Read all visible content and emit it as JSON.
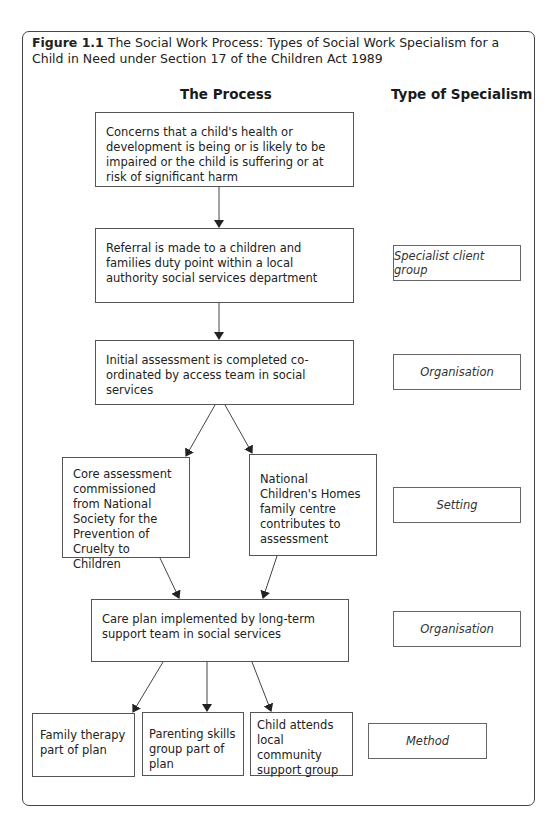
{
  "figure": {
    "label": "Figure 1.1",
    "caption": "The Social Work Process: Types of Social Work Specialism for a Child in Need under Section 17 of the Children Act 1989"
  },
  "headings": {
    "process": "The Process",
    "specialism": "Type of Specialism"
  },
  "process_steps": [
    {
      "id": "concerns",
      "text": "Concerns that a child's health or development is being or is likely to be impaired or the child is suffering or at risk of significant harm"
    },
    {
      "id": "referral",
      "text": "Referral is made to a children and families duty point within a local authority social services department"
    },
    {
      "id": "initial_assessment",
      "text": "Initial assessment is completed co-ordinated by access team in social services"
    },
    {
      "id": "core_assessment",
      "text": "Core assessment commissioned from National Society for the Prevention of Cruelty to Children"
    },
    {
      "id": "nch_centre",
      "text": "National Children's Homes family centre contributes to assessment"
    },
    {
      "id": "care_plan",
      "text": "Care plan implemented by long-term support team in social services"
    },
    {
      "id": "family_therapy",
      "text": "Family therapy part of plan"
    },
    {
      "id": "parenting_skills",
      "text": "Parenting skills group part of plan"
    },
    {
      "id": "community_group",
      "text": "Child attends local community support group"
    }
  ],
  "specialisms": [
    {
      "level": "referral",
      "text": "Specialist client group"
    },
    {
      "level": "initial_assessment",
      "text": "Organisation"
    },
    {
      "level": "assessment",
      "text": "Setting"
    },
    {
      "level": "care_plan",
      "text": "Organisation"
    },
    {
      "level": "plan_components",
      "text": "Method"
    }
  ],
  "edges": [
    [
      "concerns",
      "referral"
    ],
    [
      "referral",
      "initial_assessment"
    ],
    [
      "initial_assessment",
      "core_assessment"
    ],
    [
      "initial_assessment",
      "nch_centre"
    ],
    [
      "core_assessment",
      "care_plan"
    ],
    [
      "nch_centre",
      "care_plan"
    ],
    [
      "care_plan",
      "family_therapy"
    ],
    [
      "care_plan",
      "parenting_skills"
    ],
    [
      "care_plan",
      "community_group"
    ]
  ]
}
